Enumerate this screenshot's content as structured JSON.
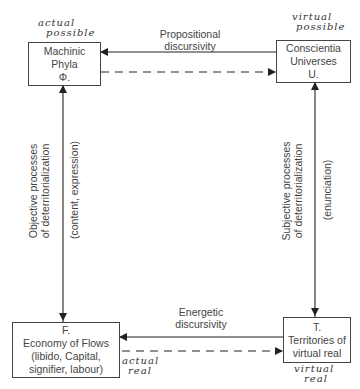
{
  "nodes": {
    "phi": {
      "lines": [
        "Machinic",
        "Phyla",
        "Φ."
      ],
      "annotation": [
        "actual",
        "possible"
      ]
    },
    "u": {
      "lines": [
        "Conscientia",
        "Universes",
        "U."
      ],
      "annotation": [
        "virtual",
        "possible"
      ]
    },
    "f": {
      "lines": [
        "F.",
        "Economy of Flows",
        "(libido, Capital,",
        "signifier, labour)"
      ],
      "annotation": [
        "actual",
        "real"
      ]
    },
    "t": {
      "lines": [
        "T.",
        "Territories of",
        "virtual real"
      ],
      "annotation": [
        "virtual",
        "real"
      ]
    }
  },
  "edges": {
    "top": {
      "label": [
        "Propositional",
        "discursivity"
      ],
      "solid": "U → Φ",
      "dashed": "Φ → U"
    },
    "bottom": {
      "label": [
        "Energetic",
        "discursivity"
      ],
      "solid": "T → F",
      "dashed": "F → T"
    },
    "left": {
      "label": [
        "Objective processes",
        "of deterritorialization"
      ],
      "sublabel": "(content, expression)",
      "direction": "Φ ↔ F"
    },
    "right": {
      "label": [
        "Subjective processes",
        "of deterritorialization"
      ],
      "sublabel": "(enunciation)",
      "direction": "U ↔ T"
    }
  },
  "colors": {
    "line": "#2a2a2a",
    "text": "#444444",
    "box_border": "#444444"
  }
}
